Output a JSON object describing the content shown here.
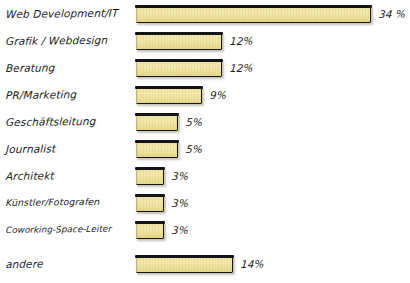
{
  "chart_data": {
    "type": "bar",
    "orientation": "horizontal",
    "title": "",
    "subtitle": "",
    "xlabel": "",
    "ylabel": "",
    "xlim": [
      0,
      34
    ],
    "grid": false,
    "legend": false,
    "value_suffix": "%",
    "categories": [
      "Web Development/IT",
      "Grafik / Webdesign",
      "Beratung",
      "PR/Marketing",
      "Geschäftsleitung",
      "Journalist",
      "Architekt",
      "Künstler/Fotografen",
      "Coworking-Space-Leiter",
      "andere"
    ],
    "values": [
      34,
      12,
      12,
      9,
      5,
      5,
      3,
      3,
      3,
      14
    ],
    "value_labels": [
      "34 %",
      "12%",
      "12%",
      "9%",
      "5%",
      "5%",
      "3%",
      "3%",
      "3%",
      "14%"
    ],
    "colors": {
      "bar_fill": "#f0e3a2",
      "bar_outline": "#161616",
      "text": "#1b1b1b",
      "background": "#ffffff"
    }
  },
  "rows": [
    {
      "label": "Web Development/IT",
      "value_label": "34 %",
      "bar_px": 235,
      "top": 2,
      "label_size": "normal"
    },
    {
      "label": "Grafik / Webdesign",
      "value_label": "12%",
      "bar_px": 86,
      "top": 29,
      "label_size": "normal"
    },
    {
      "label": "Beratung",
      "value_label": "12%",
      "bar_px": 86,
      "top": 56,
      "label_size": "normal"
    },
    {
      "label": "PR/Marketing",
      "value_label": "9%",
      "bar_px": 66,
      "top": 83,
      "label_size": "normal"
    },
    {
      "label": "Geschäftsleitung",
      "value_label": "5%",
      "bar_px": 42,
      "top": 110,
      "label_size": "normal"
    },
    {
      "label": "Journalist",
      "value_label": "5%",
      "bar_px": 42,
      "top": 137,
      "label_size": "normal"
    },
    {
      "label": "Architekt",
      "value_label": "3%",
      "bar_px": 28,
      "top": 164,
      "label_size": "normal"
    },
    {
      "label": "Künstler/Fotografen",
      "value_label": "3%",
      "bar_px": 28,
      "top": 191,
      "label_size": "small"
    },
    {
      "label": "Coworking-Space-Leiter",
      "value_label": "3%",
      "bar_px": 28,
      "top": 218,
      "label_size": "xsmall"
    },
    {
      "label": "andere",
      "value_label": "14%",
      "bar_px": 97,
      "top": 252,
      "label_size": "normal"
    }
  ]
}
